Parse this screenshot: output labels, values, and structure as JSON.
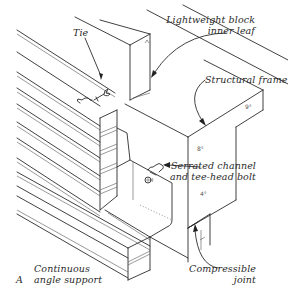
{
  "figure": {
    "panel_letter": "A",
    "labels": {
      "tie": "Tie",
      "lightweight_block_line1": "Lightweight block",
      "lightweight_block_line2": "inner leaf",
      "structural_frame": "Structural frame",
      "serrated_channel_line1": "Serrated channel",
      "serrated_channel_line2": "and tee-head bolt",
      "compressible_line1": "Compressible",
      "compressible_line2": "joint",
      "continuous_line1": "Continuous",
      "continuous_line2": "angle support"
    },
    "components": [
      "brick-outer-leaf",
      "lightweight-block-inner-leaf",
      "wall-tie",
      "structural-frame",
      "serrated-channel",
      "tee-head-bolt",
      "continuous-angle-support",
      "compressible-joint"
    ],
    "colors": {
      "line": "#2b2b2b",
      "text": "#2a2a2a",
      "background": "#ffffff"
    }
  }
}
